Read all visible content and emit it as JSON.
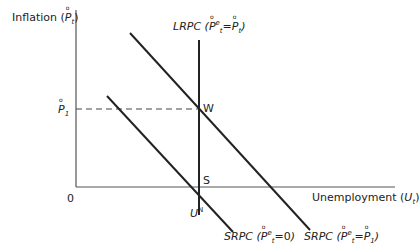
{
  "diagram": {
    "type": "phillips-curve",
    "y_axis": {
      "label": "Inflation",
      "symbol": "P",
      "subscript": "t"
    },
    "x_axis": {
      "label": "Unemployment",
      "symbol": "U",
      "subscript": "t"
    },
    "origin_label": "0",
    "y_tick": {
      "symbol": "P",
      "subscript": "1"
    },
    "x_tick": {
      "symbol": "U",
      "superscript": "N"
    },
    "curves": [
      {
        "name": "LRPC",
        "condition_left": "P",
        "condition_left_sup": "e",
        "condition_left_sub": "t",
        "condition_right": "P",
        "condition_right_sub": "t"
      },
      {
        "name": "SRPC",
        "condition_left": "P",
        "condition_left_sup": "e",
        "condition_left_sub": "t",
        "condition_value": "=0"
      },
      {
        "name": "SRPC",
        "condition_left": "P",
        "condition_left_sup": "e",
        "condition_left_sub": "t",
        "condition_right": "P",
        "condition_right_sub": "1"
      }
    ],
    "points": [
      {
        "label": "W"
      },
      {
        "label": "S"
      }
    ],
    "colors": {
      "line": "#222222",
      "background": "#ffffff"
    }
  }
}
